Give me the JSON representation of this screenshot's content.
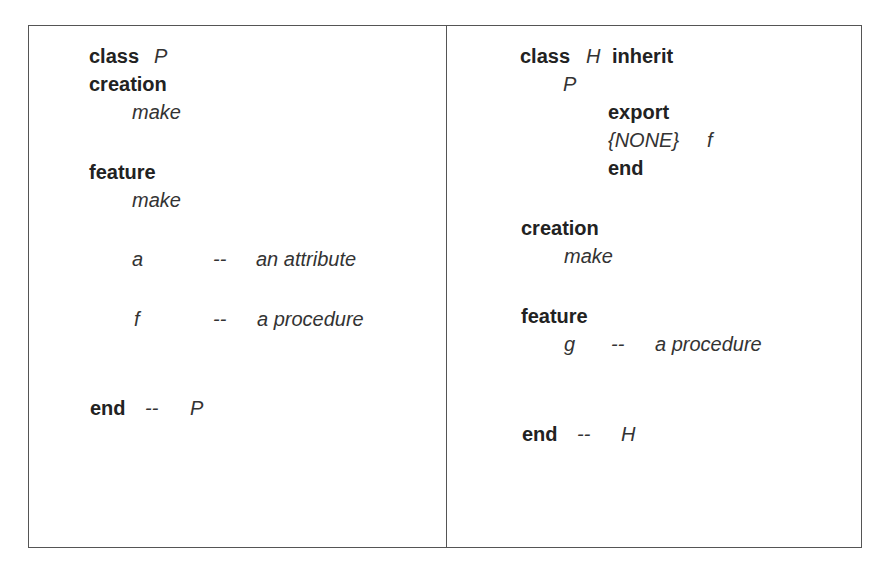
{
  "left_panel": {
    "class_keyword": "class",
    "class_name": "P",
    "creation_keyword": "creation",
    "creation_proc": "make",
    "feature_keyword": "feature",
    "feature_make": "make",
    "attr_name": "a",
    "attr_comment_dash": "--",
    "attr_comment": "an attribute",
    "proc_name": "f",
    "proc_comment_dash": "--",
    "proc_comment": "a procedure",
    "end_keyword": "end",
    "end_comment_dash": "--",
    "end_class": "P"
  },
  "right_panel": {
    "class_keyword": "class",
    "class_name": "H",
    "inherit_keyword": "inherit",
    "parent_name": "P",
    "export_keyword": "export",
    "export_target": "{NONE}",
    "export_feature": "f",
    "export_end": "end",
    "creation_keyword": "creation",
    "creation_proc": "make",
    "feature_keyword": "feature",
    "proc_name": "g",
    "proc_comment_dash": "--",
    "proc_comment": "a procedure",
    "end_keyword": "end",
    "end_comment_dash": "--",
    "end_class": "H"
  }
}
